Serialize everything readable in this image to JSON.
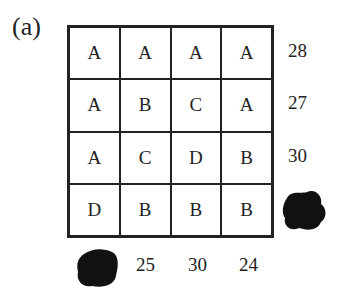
{
  "label": "(a)",
  "grid": {
    "rows": [
      [
        "A",
        "A",
        "A",
        "A"
      ],
      [
        "A",
        "B",
        "C",
        "A"
      ],
      [
        "A",
        "C",
        "D",
        "B"
      ],
      [
        "D",
        "B",
        "B",
        "B"
      ]
    ]
  },
  "row_sums": [
    "28",
    "27",
    "30",
    null
  ],
  "col_sums": [
    null,
    "25",
    "30",
    "24"
  ],
  "obscured": [
    "row-4-sum",
    "col-1-sum"
  ]
}
